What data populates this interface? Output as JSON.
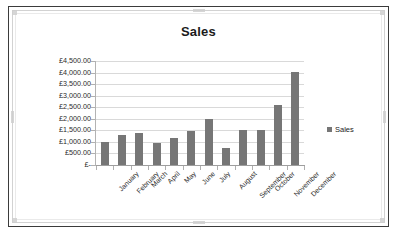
{
  "chart_object": {
    "title": "Sales",
    "legend": {
      "entries": [
        "Sales"
      ],
      "position": "right",
      "swatch_color": "#767676"
    }
  },
  "chart_data": {
    "type": "bar",
    "title": "Sales",
    "xlabel": "",
    "ylabel": "",
    "categories": [
      "January",
      "February",
      "March",
      "April",
      "May",
      "June",
      "July",
      "August",
      "September",
      "October",
      "November",
      "December"
    ],
    "series": [
      {
        "name": "Sales",
        "values": [
          1000,
          1300,
          1400,
          960,
          1180,
          1470,
          2010,
          720,
          1520,
          1520,
          2600,
          4030
        ],
        "color": "#767676"
      }
    ],
    "ylim": [
      0,
      4500
    ],
    "ytick_values": [
      0,
      500,
      1000,
      1500,
      2000,
      2500,
      3000,
      3500,
      4000,
      4500
    ],
    "ytick_labels": [
      "£-",
      "£500.00",
      "£1,000.00",
      "£1,500.00",
      "£2,000.00",
      "£2,500.00",
      "£3,000.00",
      "£3,500.00",
      "£4,000.00",
      "£4,500.00"
    ],
    "currency_symbol": "£",
    "grid": true,
    "grid_axis": "y",
    "legend": [
      "Sales"
    ],
    "legend_position": "right",
    "xtick_rotation": -45
  }
}
